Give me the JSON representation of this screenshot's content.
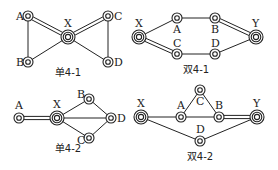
{
  "diagrams": [
    {
      "id": "single-4-1",
      "caption": "单4-1",
      "caption_pos": [
        68,
        76
      ],
      "nodes": [
        {
          "name": "A",
          "x": 28,
          "y": 16,
          "type": "node",
          "label_dx": -12,
          "label_dy": 4
        },
        {
          "name": "B",
          "x": 28,
          "y": 62,
          "type": "node",
          "label_dx": -12,
          "label_dy": 4
        },
        {
          "name": "X",
          "x": 68,
          "y": 37,
          "type": "hub",
          "label_dx": -4,
          "label_dy": -10
        },
        {
          "name": "C",
          "x": 108,
          "y": 16,
          "type": "node",
          "label_dx": 6,
          "label_dy": 4
        },
        {
          "name": "D",
          "x": 108,
          "y": 62,
          "type": "node",
          "label_dx": 6,
          "label_dy": 4
        }
      ],
      "edges": [
        {
          "from": "A",
          "to": "X",
          "style": "double"
        },
        {
          "from": "X",
          "to": "C",
          "style": "double"
        },
        {
          "from": "A",
          "to": "B",
          "style": "single"
        },
        {
          "from": "B",
          "to": "X",
          "style": "single"
        },
        {
          "from": "X",
          "to": "D",
          "style": "single"
        },
        {
          "from": "C",
          "to": "D",
          "style": "single"
        }
      ]
    },
    {
      "id": "double-4-1",
      "caption": "双4-1",
      "caption_pos": [
        196,
        73
      ],
      "nodes": [
        {
          "name": "X",
          "x": 139,
          "y": 37,
          "type": "hub",
          "label_dx": -4,
          "label_dy": -10
        },
        {
          "name": "A",
          "x": 177,
          "y": 18,
          "type": "node",
          "label_dx": -4,
          "label_dy": 15
        },
        {
          "name": "B",
          "x": 215,
          "y": 18,
          "type": "node",
          "label_dx": -4,
          "label_dy": 15
        },
        {
          "name": "C",
          "x": 177,
          "y": 54,
          "type": "node",
          "label_dx": -4,
          "label_dy": -7
        },
        {
          "name": "D",
          "x": 215,
          "y": 54,
          "type": "node",
          "label_dx": -4,
          "label_dy": -7
        },
        {
          "name": "Y",
          "x": 256,
          "y": 37,
          "type": "hub",
          "label_dx": -4,
          "label_dy": -10
        }
      ],
      "edges": [
        {
          "from": "X",
          "to": "A",
          "style": "single"
        },
        {
          "from": "A",
          "to": "B",
          "style": "single"
        },
        {
          "from": "B",
          "to": "Y",
          "style": "double"
        },
        {
          "from": "X",
          "to": "C",
          "style": "double"
        },
        {
          "from": "C",
          "to": "D",
          "style": "single"
        },
        {
          "from": "D",
          "to": "Y",
          "style": "single"
        }
      ]
    },
    {
      "id": "single-4-2",
      "caption": "单4-2",
      "caption_pos": [
        68,
        152
      ],
      "nodes": [
        {
          "name": "A",
          "x": 19,
          "y": 118,
          "type": "node",
          "label_dx": -4,
          "label_dy": -9
        },
        {
          "name": "X",
          "x": 57,
          "y": 118,
          "type": "hub",
          "label_dx": -4,
          "label_dy": -10
        },
        {
          "name": "B",
          "x": 89,
          "y": 99,
          "type": "node",
          "label_dx": -12,
          "label_dy": -1
        },
        {
          "name": "D",
          "x": 111,
          "y": 118,
          "type": "node",
          "label_dx": 6,
          "label_dy": 4
        },
        {
          "name": "C",
          "x": 89,
          "y": 138,
          "type": "node",
          "label_dx": -12,
          "label_dy": 6
        }
      ],
      "edges": [
        {
          "from": "A",
          "to": "X",
          "style": "double"
        },
        {
          "from": "X",
          "to": "B",
          "style": "single"
        },
        {
          "from": "X",
          "to": "D",
          "style": "single"
        },
        {
          "from": "X",
          "to": "C",
          "style": "single"
        },
        {
          "from": "B",
          "to": "D",
          "style": "single"
        },
        {
          "from": "C",
          "to": "D",
          "style": "single"
        }
      ]
    },
    {
      "id": "double-4-2",
      "caption": "双4-2",
      "caption_pos": [
        200,
        160
      ],
      "nodes": [
        {
          "name": "X",
          "x": 141,
          "y": 117,
          "type": "hub",
          "label_dx": -4,
          "label_dy": -10
        },
        {
          "name": "A",
          "x": 181,
          "y": 117,
          "type": "node",
          "label_dx": -4,
          "label_dy": -8
        },
        {
          "name": "C",
          "x": 200,
          "y": 90,
          "type": "node",
          "label_dx": -4,
          "label_dy": 15
        },
        {
          "name": "B",
          "x": 219,
          "y": 117,
          "type": "node",
          "label_dx": -4,
          "label_dy": -8
        },
        {
          "name": "Y",
          "x": 257,
          "y": 117,
          "type": "hub",
          "label_dx": -4,
          "label_dy": -10
        },
        {
          "name": "D",
          "x": 200,
          "y": 141,
          "type": "node",
          "label_dx": -4,
          "label_dy": -8
        }
      ],
      "edges": [
        {
          "from": "X",
          "to": "A",
          "style": "single"
        },
        {
          "from": "A",
          "to": "B",
          "style": "single"
        },
        {
          "from": "A",
          "to": "C",
          "style": "single"
        },
        {
          "from": "C",
          "to": "B",
          "style": "single"
        },
        {
          "from": "B",
          "to": "Y",
          "style": "double"
        },
        {
          "from": "X",
          "to": "D",
          "style": "single"
        },
        {
          "from": "D",
          "to": "Y",
          "style": "single"
        }
      ]
    }
  ],
  "colors": {
    "stroke": "#222222",
    "background": "#ffffff"
  }
}
